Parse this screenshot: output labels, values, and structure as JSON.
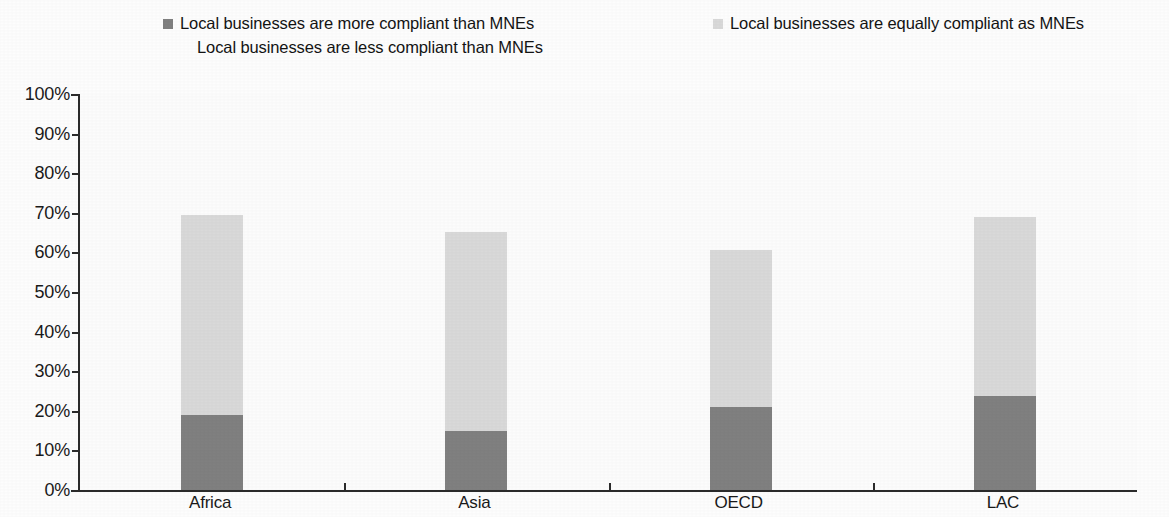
{
  "legend": {
    "items": [
      {
        "label": "Local businesses are more compliant than MNEs",
        "color": "#808080",
        "has_marker": true
      },
      {
        "label": "Local businesses are equally compliant as MNEs",
        "color": "#d9d9d9",
        "has_marker": true
      },
      {
        "label": "Local businesses are less compliant than MNEs",
        "color": "#ffffff",
        "has_marker": false
      }
    ]
  },
  "axis": {
    "y_ticks": [
      "100%",
      "90%",
      "80%",
      "70%",
      "60%",
      "50%",
      "40%",
      "30%",
      "20%",
      "10%",
      "0%"
    ]
  },
  "chart_data": {
    "type": "bar",
    "stacked": true,
    "title": "",
    "subtitle": "",
    "xlabel": "",
    "ylabel": "",
    "ylim": [
      0,
      100
    ],
    "ytick_step": 10,
    "ytick_format": "percent",
    "grid": false,
    "legend_position": "top",
    "categories": [
      "Africa",
      "Asia",
      "OECD",
      "LAC"
    ],
    "series": [
      {
        "name": "Local businesses are more compliant than MNEs",
        "color": "#808080",
        "values": [
          18.9,
          14.9,
          21.0,
          23.7
        ]
      },
      {
        "name": "Local businesses are equally compliant as MNEs",
        "color": "#d9d9d9",
        "values": [
          50.5,
          50.3,
          39.6,
          45.3
        ]
      }
    ],
    "stack_totals": [
      69.4,
      65.2,
      60.6,
      69.0
    ]
  }
}
